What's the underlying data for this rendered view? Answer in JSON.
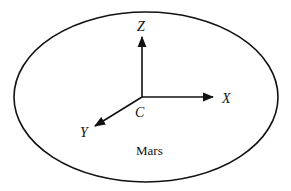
{
  "diagram": {
    "type": "coordinate-frame",
    "body": {
      "label": "Mars",
      "shape": "ellipse"
    },
    "origin": {
      "label": "C"
    },
    "axes": [
      {
        "name": "x-axis",
        "label": "X",
        "direction": "right"
      },
      {
        "name": "y-axis",
        "label": "Y",
        "direction": "down-left"
      },
      {
        "name": "z-axis",
        "label": "Z",
        "direction": "up"
      }
    ],
    "colors": {
      "stroke": "#111111",
      "background": "#ffffff"
    }
  }
}
